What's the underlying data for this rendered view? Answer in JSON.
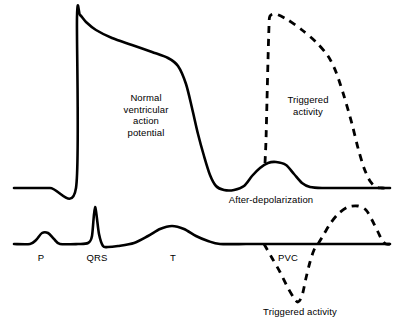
{
  "figure": {
    "background_color": "#ffffff",
    "stroke_color": "#000000",
    "width": 402,
    "height": 330
  },
  "labels": {
    "action_potential": "Normal\nventricular\naction\npotential",
    "triggered_activity_upper": "Triggered\nactivity",
    "afterdepolarization": "After-depolarization",
    "p_wave": "P",
    "qrs_complex": "QRS",
    "t_wave": "T",
    "pvc": "PVC",
    "triggered_activity_lower": "Triggered activity"
  },
  "chart_data": {
    "type": "line",
    "xlabel": "",
    "ylabel": "",
    "grid": false,
    "legend": "none",
    "axis_ranges": {
      "x": [
        0,
        402
      ],
      "y": [
        0,
        330
      ]
    },
    "note": "y values are screen pixel coordinates; smaller y is more positive voltage",
    "baselines": {
      "action_potential_resting_y": 188,
      "ecg_isoelectric_y": 244
    },
    "series": [
      {
        "name": "normal-ventricular-action-potential",
        "style": "solid",
        "stroke_width": 2.6,
        "description": "Phase 0 upstroke, phase 1 notch, phase 2 plateau, phase 3 repolarization, then a delayed afterdepolarization hump",
        "points": [
          [
            14,
            188
          ],
          [
            50,
            188
          ],
          [
            76,
            188
          ],
          [
            77,
            17
          ],
          [
            80,
            15
          ],
          [
            86,
            22
          ],
          [
            96,
            30
          ],
          [
            112,
            38
          ],
          [
            132,
            45
          ],
          [
            152,
            52
          ],
          [
            168,
            58
          ],
          [
            178,
            66
          ],
          [
            186,
            84
          ],
          [
            192,
            108
          ],
          [
            198,
            134
          ],
          [
            204,
            156
          ],
          [
            210,
            175
          ],
          [
            216,
            186
          ],
          [
            224,
            190
          ],
          [
            234,
            190
          ],
          [
            244,
            186
          ],
          [
            252,
            176
          ],
          [
            260,
            168
          ],
          [
            268,
            163
          ],
          [
            276,
            162
          ],
          [
            286,
            165
          ],
          [
            294,
            174
          ],
          [
            302,
            183
          ],
          [
            310,
            187
          ],
          [
            322,
            188
          ],
          [
            350,
            188
          ],
          [
            390,
            188
          ]
        ]
      },
      {
        "name": "triggered-activity-action-potential",
        "style": "dashed",
        "stroke_width": 2.8,
        "dash_pattern": [
          7,
          6
        ],
        "description": "Dashed triggered beat arising from the afterdepolarization, reaching full overshoot then repolarizing to baseline",
        "points": [
          [
            265,
            163
          ],
          [
            266,
            140
          ],
          [
            267,
            100
          ],
          [
            268,
            60
          ],
          [
            269,
            26
          ],
          [
            270,
            16
          ],
          [
            276,
            14
          ],
          [
            288,
            20
          ],
          [
            302,
            30
          ],
          [
            316,
            42
          ],
          [
            328,
            56
          ],
          [
            336,
            72
          ],
          [
            344,
            96
          ],
          [
            352,
            124
          ],
          [
            358,
            148
          ],
          [
            364,
            168
          ],
          [
            370,
            181
          ],
          [
            376,
            187
          ],
          [
            382,
            188
          ],
          [
            390,
            188
          ]
        ]
      },
      {
        "name": "surface-ecg",
        "style": "solid",
        "stroke_width": 2.6,
        "description": "P wave, QRS complex, and T wave on the isoelectric line",
        "points": [
          [
            14,
            244
          ],
          [
            30,
            244
          ],
          [
            36,
            240
          ],
          [
            42,
            233
          ],
          [
            48,
            233
          ],
          [
            54,
            239
          ],
          [
            60,
            244
          ],
          [
            78,
            244
          ],
          [
            88,
            243
          ],
          [
            92,
            236
          ],
          [
            95,
            207
          ],
          [
            99,
            234
          ],
          [
            103,
            246
          ],
          [
            108,
            247
          ],
          [
            118,
            246
          ],
          [
            134,
            243
          ],
          [
            148,
            236
          ],
          [
            160,
            229
          ],
          [
            172,
            226
          ],
          [
            184,
            229
          ],
          [
            196,
            236
          ],
          [
            208,
            241
          ],
          [
            220,
            244
          ],
          [
            246,
            244
          ],
          [
            264,
            244
          ],
          [
            300,
            244
          ],
          [
            340,
            244
          ],
          [
            390,
            244
          ]
        ]
      },
      {
        "name": "pvc-and-triggered-beat-ecg",
        "style": "dashed",
        "stroke_width": 2.8,
        "dash_pattern": [
          7,
          6
        ],
        "description": "Dashed premature ventricular complex with deep negative deflection followed by a broad positive triggered deflection",
        "points": [
          [
            264,
            244
          ],
          [
            272,
            258
          ],
          [
            280,
            272
          ],
          [
            288,
            288
          ],
          [
            294,
            298
          ],
          [
            298,
            302
          ],
          [
            302,
            296
          ],
          [
            306,
            278
          ],
          [
            310,
            262
          ],
          [
            314,
            250
          ],
          [
            318,
            244
          ],
          [
            324,
            234
          ],
          [
            330,
            224
          ],
          [
            338,
            214
          ],
          [
            348,
            207
          ],
          [
            358,
            206
          ],
          [
            366,
            210
          ],
          [
            372,
            220
          ],
          [
            378,
            232
          ],
          [
            382,
            240
          ],
          [
            386,
            244
          ],
          [
            392,
            244
          ]
        ]
      }
    ],
    "annotations": [
      {
        "text": "Normal ventricular action potential",
        "x": 146,
        "y": 115,
        "anchor": "middle"
      },
      {
        "text": "Triggered activity",
        "x": 308,
        "y": 105,
        "anchor": "middle"
      },
      {
        "text": "After-depolarization",
        "x": 271,
        "y": 202,
        "anchor": "middle"
      },
      {
        "text": "P",
        "x": 41,
        "y": 260,
        "anchor": "middle"
      },
      {
        "text": "QRS",
        "x": 97,
        "y": 260,
        "anchor": "middle"
      },
      {
        "text": "T",
        "x": 173,
        "y": 260,
        "anchor": "middle"
      },
      {
        "text": "PVC",
        "x": 288,
        "y": 260,
        "anchor": "middle"
      },
      {
        "text": "Triggered activity",
        "x": 300,
        "y": 314,
        "anchor": "middle"
      }
    ]
  }
}
